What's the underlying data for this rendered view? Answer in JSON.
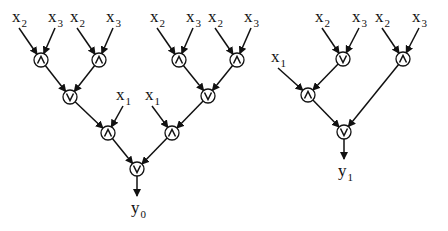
{
  "diagram": {
    "colors": {
      "stroke": "#111111",
      "background": "#ffffff"
    },
    "gate_radius": 7,
    "nodes": [
      {
        "id": "a1",
        "type": "and",
        "x": 41,
        "y": 60
      },
      {
        "id": "a2",
        "type": "and",
        "x": 99,
        "y": 60
      },
      {
        "id": "o1",
        "type": "or",
        "x": 70,
        "y": 97
      },
      {
        "id": "a3",
        "type": "and",
        "x": 179,
        "y": 60
      },
      {
        "id": "a4",
        "type": "and",
        "x": 237,
        "y": 60
      },
      {
        "id": "o2",
        "type": "or",
        "x": 208,
        "y": 96
      },
      {
        "id": "a5",
        "type": "and",
        "x": 108,
        "y": 133
      },
      {
        "id": "a6",
        "type": "and",
        "x": 172,
        "y": 133
      },
      {
        "id": "o3",
        "type": "or",
        "x": 137,
        "y": 169
      },
      {
        "id": "o4",
        "type": "or",
        "x": 343,
        "y": 59
      },
      {
        "id": "a7",
        "type": "and",
        "x": 403,
        "y": 59
      },
      {
        "id": "a8",
        "type": "and",
        "x": 308,
        "y": 95
      },
      {
        "id": "o5",
        "type": "or",
        "x": 344,
        "y": 132
      }
    ],
    "inputs": [
      {
        "var": "x",
        "sub": "2",
        "x": 17,
        "y": 22,
        "to": "a1"
      },
      {
        "var": "x",
        "sub": "3",
        "x": 53,
        "y": 22,
        "to": "a1"
      },
      {
        "var": "x",
        "sub": "2",
        "x": 75,
        "y": 22,
        "to": "a2"
      },
      {
        "var": "x",
        "sub": "3",
        "x": 111,
        "y": 22,
        "to": "a2"
      },
      {
        "var": "x",
        "sub": "2",
        "x": 155,
        "y": 22,
        "to": "a3"
      },
      {
        "var": "x",
        "sub": "3",
        "x": 191,
        "y": 22,
        "to": "a3"
      },
      {
        "var": "x",
        "sub": "2",
        "x": 213,
        "y": 22,
        "to": "a4"
      },
      {
        "var": "x",
        "sub": "3",
        "x": 249,
        "y": 22,
        "to": "a4"
      },
      {
        "var": "x",
        "sub": "1",
        "x": 121,
        "y": 100,
        "to": "a5"
      },
      {
        "var": "x",
        "sub": "1",
        "x": 150,
        "y": 100,
        "to": "a6"
      },
      {
        "var": "x",
        "sub": "2",
        "x": 320,
        "y": 22,
        "to": "o4"
      },
      {
        "var": "x",
        "sub": "3",
        "x": 357,
        "y": 22,
        "to": "o4"
      },
      {
        "var": "x",
        "sub": "2",
        "x": 380,
        "y": 22,
        "to": "a7"
      },
      {
        "var": "x",
        "sub": "3",
        "x": 417,
        "y": 22,
        "to": "a7"
      },
      {
        "var": "x",
        "sub": "1",
        "x": 276,
        "y": 62,
        "to": "a8"
      }
    ],
    "edges": [
      [
        "a1",
        "o1"
      ],
      [
        "a2",
        "o1"
      ],
      [
        "a3",
        "o2"
      ],
      [
        "a4",
        "o2"
      ],
      [
        "o1",
        "a5"
      ],
      [
        "o2",
        "a6"
      ],
      [
        "a5",
        "o3"
      ],
      [
        "a6",
        "o3"
      ],
      [
        "o4",
        "a8"
      ],
      [
        "a8",
        "o5"
      ],
      [
        "a7",
        "o5"
      ]
    ],
    "outputs": [
      {
        "var": "y",
        "sub": "0",
        "from": "o3",
        "x": 135,
        "y": 213
      },
      {
        "var": "y",
        "sub": "1",
        "from": "o5",
        "x": 342,
        "y": 176
      }
    ]
  }
}
